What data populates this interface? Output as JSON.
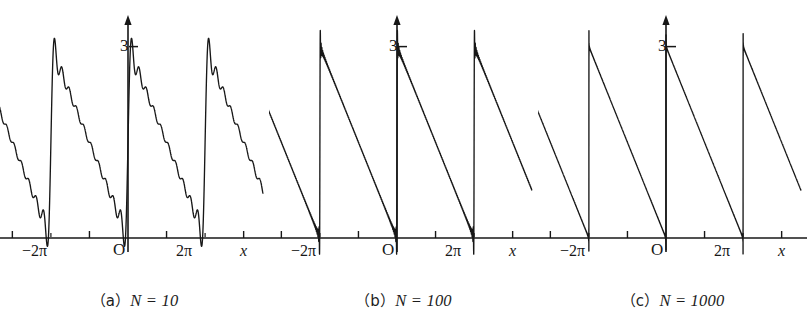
{
  "figure": {
    "title": "",
    "background_color": "#ffffff",
    "stroke_color": "#171717",
    "panel_count": 3
  },
  "panels": [
    {
      "id": "panel-a",
      "caption_prefix": "（a）",
      "caption_body": "N = 10",
      "N": 10,
      "y_tick_label": "3",
      "origin_label": "O",
      "x_tick_left_label": "−2π",
      "x_tick_right_label": "2π",
      "x_axis_label": "x"
    },
    {
      "id": "panel-b",
      "caption_prefix": "（b）",
      "caption_body": "N = 100",
      "N": 100,
      "y_tick_label": "3",
      "origin_label": "O",
      "x_tick_left_label": "−2π",
      "x_tick_right_label": "2π",
      "x_axis_label": "x"
    },
    {
      "id": "panel-c",
      "caption_prefix": "（c）",
      "caption_body": "N = 1000",
      "N": 1000,
      "y_tick_label": "3",
      "origin_label": "O",
      "x_tick_left_label": "−2π",
      "x_tick_right_label": "2π",
      "x_axis_label": "x"
    }
  ],
  "chart_data": [
    {
      "type": "line",
      "title": "（a）N = 10",
      "series_name": "Fourier partial sum S_10(x)",
      "function": "sawtooth: f(x) = 3*(1 - frac(x/(2*pi) + 0.5)) approximated by sum_{n=1..N} (3/(n*pi))*sin(n*x)",
      "N": 10,
      "xlabel": "x",
      "ylabel": "",
      "xlim": [
        -10.995574,
        10.995574
      ],
      "ylim": [
        -0.35,
        3.75
      ],
      "period": 6.283185,
      "amplitude": 3,
      "xticks": [
        -6.283185,
        0,
        6.283185
      ],
      "xticklabels": [
        "−2π",
        "O",
        "2π"
      ],
      "yticks": [
        3
      ],
      "yticklabels": [
        "3"
      ],
      "grid": false,
      "legend": false,
      "overshoot_peak": 3.35,
      "ripple_visible": true
    },
    {
      "type": "line",
      "title": "（b）N = 100",
      "series_name": "Fourier partial sum S_100(x)",
      "function": "sawtooth: f(x) = 3*(1 - frac(x/(2*pi) + 0.5)) approximated by sum_{n=1..N} (3/(n*pi))*sin(n*x)",
      "N": 100,
      "xlabel": "x",
      "ylabel": "",
      "xlim": [
        -10.995574,
        10.995574
      ],
      "ylim": [
        -0.35,
        3.75
      ],
      "period": 6.283185,
      "amplitude": 3,
      "xticks": [
        -6.283185,
        0,
        6.283185
      ],
      "xticklabels": [
        "−2π",
        "O",
        "2π"
      ],
      "yticks": [
        3
      ],
      "yticklabels": [
        "3"
      ],
      "grid": false,
      "legend": false,
      "overshoot_peak": 3.27,
      "ripple_visible": false
    },
    {
      "type": "line",
      "title": "（c）N = 1000",
      "series_name": "Fourier partial sum S_1000(x)",
      "function": "sawtooth: f(x) = 3*(1 - frac(x/(2*pi) + 0.5)) approximated by sum_{n=1..N} (3/(n*pi))*sin(n*x)",
      "N": 1000,
      "xlabel": "x",
      "ylabel": "",
      "xlim": [
        -10.995574,
        10.995574
      ],
      "ylim": [
        -0.35,
        3.75
      ],
      "period": 6.283185,
      "amplitude": 3,
      "xticks": [
        -6.283185,
        0,
        6.283185
      ],
      "xticklabels": [
        "−2π",
        "O",
        "2π"
      ],
      "yticks": [
        3
      ],
      "yticklabels": [
        "3"
      ],
      "grid": false,
      "legend": false,
      "overshoot_peak": 3.27,
      "ripple_visible": false
    }
  ]
}
